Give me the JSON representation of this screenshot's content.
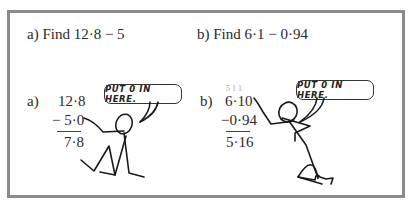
{
  "problem_a": {
    "prompt": "a)  Find 12·8 − 5",
    "label": "a)",
    "minuend": "12·8",
    "subtrahend": "− 5·0",
    "result": "7·8",
    "speech": "PUT 0 IN HERE."
  },
  "problem_b": {
    "prompt": "b)  Find 6·1 − 0·94",
    "label": "b)",
    "borrow_marks": "5 1 1",
    "minuend": "6·10",
    "subtrahend": "−0·94",
    "result": "5·16",
    "speech": "PUT 0 IN HERE."
  }
}
